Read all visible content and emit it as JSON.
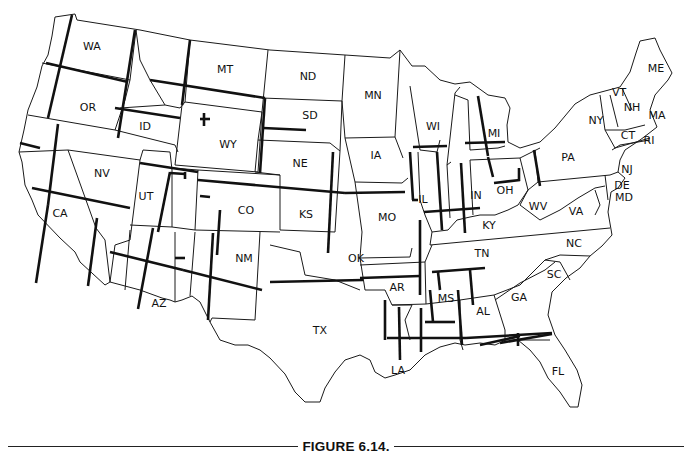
{
  "figure": {
    "caption": "FIGURE 6.14.",
    "colors": {
      "background": "#ffffff",
      "line": "#1a1a1a"
    }
  },
  "states": [
    {
      "abbr": "WA",
      "x": 92,
      "y": 47
    },
    {
      "abbr": "OR",
      "x": 88,
      "y": 108
    },
    {
      "abbr": "ID",
      "x": 145,
      "y": 127
    },
    {
      "abbr": "MT",
      "x": 225,
      "y": 70
    },
    {
      "abbr": "WY",
      "x": 228,
      "y": 145
    },
    {
      "abbr": "ND",
      "x": 308,
      "y": 77
    },
    {
      "abbr": "SD",
      "x": 310,
      "y": 116
    },
    {
      "abbr": "NE",
      "x": 300,
      "y": 164
    },
    {
      "abbr": "MN",
      "x": 373,
      "y": 96
    },
    {
      "abbr": "IA",
      "x": 376,
      "y": 156
    },
    {
      "abbr": "WI",
      "x": 433,
      "y": 127
    },
    {
      "abbr": "MI",
      "x": 494,
      "y": 134
    },
    {
      "abbr": "NV",
      "x": 102,
      "y": 174
    },
    {
      "abbr": "UT",
      "x": 146,
      "y": 197
    },
    {
      "abbr": "CO",
      "x": 246,
      "y": 211
    },
    {
      "abbr": "KS",
      "x": 306,
      "y": 215
    },
    {
      "abbr": "MO",
      "x": 387,
      "y": 218
    },
    {
      "abbr": "IL",
      "x": 423,
      "y": 200
    },
    {
      "abbr": "IN",
      "x": 476,
      "y": 196
    },
    {
      "abbr": "OH",
      "x": 505,
      "y": 191
    },
    {
      "abbr": "CA",
      "x": 60,
      "y": 214
    },
    {
      "abbr": "NM",
      "x": 244,
      "y": 259
    },
    {
      "abbr": "OK",
      "x": 356,
      "y": 259
    },
    {
      "abbr": "AR",
      "x": 397,
      "y": 288
    },
    {
      "abbr": "TN",
      "x": 482,
      "y": 254
    },
    {
      "abbr": "KY",
      "x": 489,
      "y": 226
    },
    {
      "abbr": "WV",
      "x": 538,
      "y": 207
    },
    {
      "abbr": "VA",
      "x": 576,
      "y": 212
    },
    {
      "abbr": "NC",
      "x": 574,
      "y": 244
    },
    {
      "abbr": "SC",
      "x": 554,
      "y": 275
    },
    {
      "abbr": "GA",
      "x": 519,
      "y": 298
    },
    {
      "abbr": "AL",
      "x": 483,
      "y": 312
    },
    {
      "abbr": "MS",
      "x": 446,
      "y": 299
    },
    {
      "abbr": "LA",
      "x": 398,
      "y": 371
    },
    {
      "abbr": "AZ",
      "x": 159,
      "y": 304
    },
    {
      "abbr": "TX",
      "x": 320,
      "y": 331
    },
    {
      "abbr": "FL",
      "x": 558,
      "y": 372
    },
    {
      "abbr": "PA",
      "x": 568,
      "y": 158
    },
    {
      "abbr": "NY",
      "x": 596,
      "y": 121
    },
    {
      "abbr": "NJ",
      "x": 627,
      "y": 170
    },
    {
      "abbr": "DE",
      "x": 622,
      "y": 186
    },
    {
      "abbr": "MD",
      "x": 624,
      "y": 198
    },
    {
      "abbr": "VT",
      "x": 619,
      "y": 93
    },
    {
      "abbr": "NH",
      "x": 632,
      "y": 108
    },
    {
      "abbr": "MA",
      "x": 657,
      "y": 116
    },
    {
      "abbr": "CT",
      "x": 628,
      "y": 136
    },
    {
      "abbr": "RI",
      "x": 649,
      "y": 141
    },
    {
      "abbr": "ME",
      "x": 656,
      "y": 69
    }
  ]
}
